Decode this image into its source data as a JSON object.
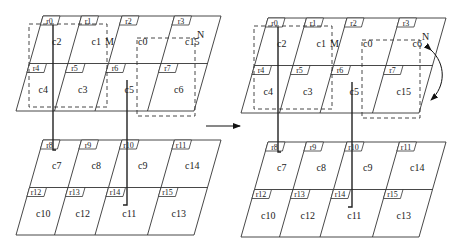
{
  "figure": {
    "left_panel": {
      "top_grid": {
        "tags": [
          "r0",
          "r1",
          "r2",
          "r3",
          "r4",
          "r5",
          "r6",
          "r7"
        ],
        "cells": [
          "c2",
          "c1",
          "c0",
          "c15",
          "c4",
          "c3",
          "c5",
          "c6"
        ]
      },
      "bottom_grid": {
        "tags": [
          "r8",
          "r9",
          "r10",
          "r11",
          "r12",
          "r13",
          "r14",
          "r15"
        ],
        "cells": [
          "c7",
          "c8",
          "c9",
          "c14",
          "c10",
          "c12",
          "c11",
          "c13"
        ]
      },
      "region_labels": {
        "m": "M",
        "n": "N"
      }
    },
    "right_panel": {
      "top_grid": {
        "tags": [
          "r0",
          "r1",
          "r2",
          "r3",
          "r4",
          "r5",
          "r6",
          "r7"
        ],
        "cells": [
          "c2",
          "c1",
          "c0",
          "c6",
          "c4",
          "c3",
          "c5",
          "c15"
        ]
      },
      "bottom_grid": {
        "tags": [
          "r8",
          "r9",
          "r10",
          "r11",
          "r12",
          "r13",
          "r14",
          "r15"
        ],
        "cells": [
          "c7",
          "c8",
          "c9",
          "c14",
          "c10",
          "c12",
          "c11",
          "c13"
        ]
      },
      "region_labels": {
        "m": "M",
        "n": "N"
      }
    },
    "arrow": "transition-arrow",
    "swap": "swap-arrow"
  }
}
